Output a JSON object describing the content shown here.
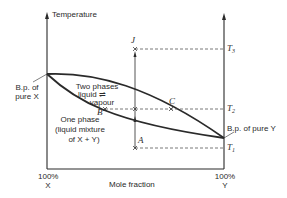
{
  "diagram": {
    "y_axis_label": "Temperature",
    "x_axis_label": "Mole fraction",
    "x_left_label_line1": "100%",
    "x_left_label_line2": "X",
    "x_right_label_line1": "100%",
    "x_right_label_line2": "Y",
    "bp_x_label_line1": "B.p. of",
    "bp_x_label_line2": "pure X",
    "bp_y_label": "B.p. of pure Y",
    "two_phase_line1": "Two phases",
    "two_phase_line2": "liquid ⇌",
    "two_phase_line3": "vapour",
    "one_phase_line1": "One phase",
    "one_phase_line2": "(liquid mixture",
    "one_phase_line3": "of X + Y)",
    "points": {
      "J": "J",
      "A": "A",
      "B": "B",
      "C": "C"
    },
    "temps": {
      "T3": "T",
      "T3_sub": "3",
      "T2": "T",
      "T2_sub": "2",
      "T1": "T",
      "T1_sub": "1"
    },
    "colors": {
      "line": "#2a2a2a",
      "dashed": "#555555",
      "background": "#ffffff"
    }
  }
}
